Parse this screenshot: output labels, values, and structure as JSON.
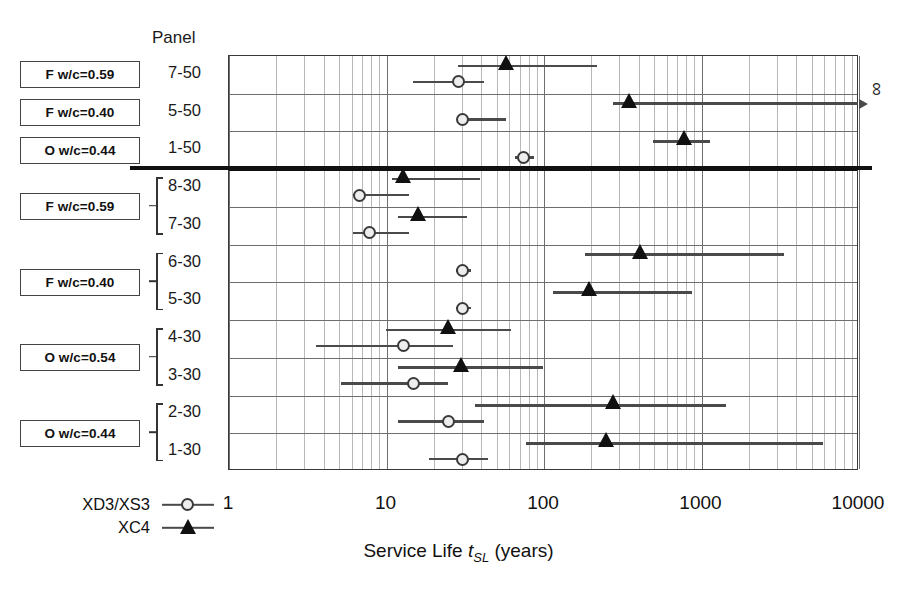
{
  "figure": {
    "panel_header": "Panel",
    "axis_title_prefix": "Service Life ",
    "axis_title_var": "t",
    "axis_title_sub": "SL",
    "axis_title_suffix": " (years)",
    "infinity_symbol": "∞"
  },
  "legend": {
    "items": [
      {
        "label": "XD3/XS3",
        "marker": "open-circle"
      },
      {
        "label": "XC4",
        "marker": "filled-triangle"
      }
    ]
  },
  "mix_boxes": [
    {
      "label": "F w/c=0.59",
      "rows": [
        "7-50"
      ],
      "braced": false
    },
    {
      "label": "F w/c=0.40",
      "rows": [
        "5-50"
      ],
      "braced": false
    },
    {
      "label": "O w/c=0.44",
      "rows": [
        "1-50"
      ],
      "braced": false
    },
    {
      "label": "F w/c=0.59",
      "rows": [
        "8-30",
        "7-30"
      ],
      "braced": true
    },
    {
      "label": "F w/c=0.40",
      "rows": [
        "6-30",
        "5-30"
      ],
      "braced": true
    },
    {
      "label": "O w/c=0.54",
      "rows": [
        "4-30",
        "3-30"
      ],
      "braced": true
    },
    {
      "label": "O w/c=0.44",
      "rows": [
        "2-30",
        "1-30"
      ],
      "braced": true
    }
  ],
  "chart_data": {
    "type": "scatter",
    "orientation": "horizontal",
    "title": "",
    "xlabel": "Service Life t_SL (years)",
    "ylabel": "Panel",
    "xscale": "log",
    "xlim": [
      1,
      10000
    ],
    "xticks": [
      "1",
      "10",
      "100",
      "1000",
      "10000"
    ],
    "xtick_values": [
      1,
      10,
      100,
      1000,
      10000
    ],
    "grid": "log-minor-vertical",
    "legend_position": "bottom-left",
    "series": [
      {
        "name": "XD3/XS3",
        "marker": "open-circle"
      },
      {
        "name": "XC4",
        "marker": "filled-triangle"
      }
    ],
    "categories": [
      "7-50",
      "5-50",
      "1-50",
      "8-30",
      "7-30",
      "6-30",
      "5-30",
      "4-30",
      "3-30",
      "2-30",
      "1-30"
    ],
    "group_divider_after": "1-50",
    "points": [
      {
        "panel": "7-50",
        "series": "XD3/XS3",
        "value": 29,
        "low": 15,
        "high": 42,
        "capped": false
      },
      {
        "panel": "7-50",
        "series": "XC4",
        "value": 58,
        "low": 29,
        "high": 220,
        "capped": false
      },
      {
        "panel": "5-50",
        "series": "XD3/XS3",
        "value": 31,
        "low": 31,
        "high": 58,
        "capped": false
      },
      {
        "panel": "5-50",
        "series": "XC4",
        "value": 350,
        "low": 280,
        "high": 10000,
        "capped": true
      },
      {
        "panel": "1-50",
        "series": "XD3/XS3",
        "value": 75,
        "low": 66,
        "high": 88,
        "capped": false
      },
      {
        "panel": "1-50",
        "series": "XC4",
        "value": 790,
        "low": 500,
        "high": 1150,
        "capped": false
      },
      {
        "panel": "8-30",
        "series": "XD3/XS3",
        "value": 6.8,
        "low": 6.2,
        "high": 14,
        "capped": false
      },
      {
        "panel": "8-30",
        "series": "XC4",
        "value": 13,
        "low": 11,
        "high": 40,
        "capped": false
      },
      {
        "panel": "7-30",
        "series": "XD3/XS3",
        "value": 7.9,
        "low": 6.2,
        "high": 14,
        "capped": false
      },
      {
        "panel": "7-30",
        "series": "XC4",
        "value": 16,
        "low": 12,
        "high": 33,
        "capped": false
      },
      {
        "panel": "6-30",
        "series": "XD3/XS3",
        "value": 31,
        "low": 28,
        "high": 35,
        "capped": false
      },
      {
        "panel": "6-30",
        "series": "XC4",
        "value": 415,
        "low": 185,
        "high": 3400,
        "capped": false
      },
      {
        "panel": "5-30",
        "series": "XD3/XS3",
        "value": 31,
        "low": 28,
        "high": 35,
        "capped": false
      },
      {
        "panel": "5-30",
        "series": "XC4",
        "value": 195,
        "low": 116,
        "high": 880,
        "capped": false
      },
      {
        "panel": "4-30",
        "series": "XD3/XS3",
        "value": 13,
        "low": 3.6,
        "high": 27,
        "capped": false
      },
      {
        "panel": "4-30",
        "series": "XC4",
        "value": 25,
        "low": 10,
        "high": 63,
        "capped": false
      },
      {
        "panel": "3-30",
        "series": "XD3/XS3",
        "value": 15,
        "low": 5.2,
        "high": 25,
        "capped": false
      },
      {
        "panel": "3-30",
        "series": "XC4",
        "value": 30,
        "low": 12,
        "high": 100,
        "capped": false
      },
      {
        "panel": "2-30",
        "series": "XD3/XS3",
        "value": 25,
        "low": 12,
        "high": 42,
        "capped": false
      },
      {
        "panel": "2-30",
        "series": "XC4",
        "value": 280,
        "low": 37,
        "high": 1450,
        "capped": false
      },
      {
        "panel": "1-30",
        "series": "XD3/XS3",
        "value": 31,
        "low": 19,
        "high": 45,
        "capped": false
      },
      {
        "panel": "1-30",
        "series": "XC4",
        "value": 250,
        "low": 78,
        "high": 6000,
        "capped": false
      }
    ]
  },
  "geometry": {
    "plot_left": 228,
    "plot_right": 858,
    "plot_top": 55,
    "plot_bottom": 470,
    "decade_px": 157.5,
    "rows": 11
  }
}
